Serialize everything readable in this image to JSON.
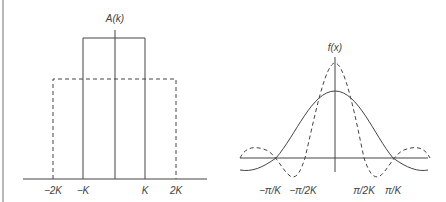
{
  "left_panel": {
    "y_label": "A(k)",
    "x_ticks": [
      "−2K",
      "−K",
      "K",
      "2K"
    ],
    "series": [
      {
        "name": "narrow-box",
        "style": "solid",
        "from": "−K",
        "to": "K",
        "height": "tall"
      },
      {
        "name": "wide-box",
        "style": "dashed",
        "from": "−2K",
        "to": "2K",
        "height": "short"
      }
    ]
  },
  "right_panel": {
    "y_label": "f(x)",
    "x_ticks": [
      "−π/K",
      "−π/2K",
      "π/2K",
      "π/K"
    ],
    "series": [
      {
        "name": "sinc-wide",
        "style": "solid",
        "zeros": [
          "−π/K",
          "π/K"
        ]
      },
      {
        "name": "sinc-narrow",
        "style": "dashed",
        "zeros": [
          "−π/2K",
          "π/2K"
        ]
      }
    ]
  },
  "colors": {
    "line": "#444444",
    "frame": "#b8b8b8"
  }
}
